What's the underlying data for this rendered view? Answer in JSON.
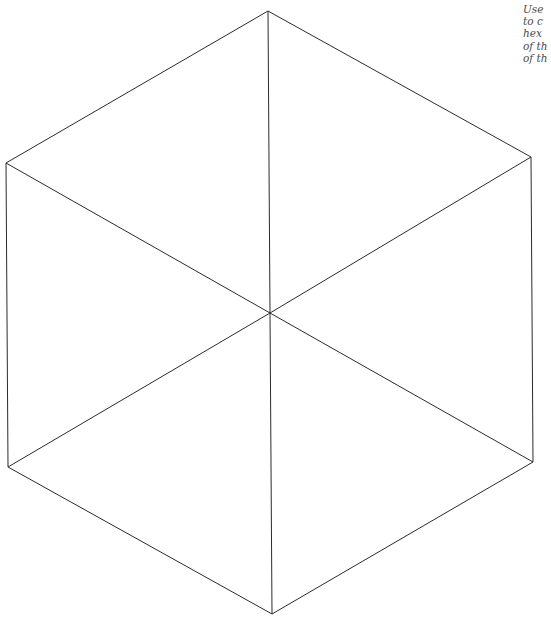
{
  "instructions": {
    "lines": [
      "Use",
      "to c",
      "hex",
      "of th",
      "of th"
    ]
  },
  "hexagon": {
    "stroke_color": "#2b2b2b",
    "stroke_width": 1,
    "center": [
      270,
      313
    ],
    "vertices": {
      "top": [
        268,
        11
      ],
      "upper_right": [
        531,
        157
      ],
      "lower_right": [
        533,
        462
      ],
      "bottom": [
        272,
        614
      ],
      "lower_left": [
        8,
        467
      ],
      "upper_left": [
        6,
        163
      ]
    }
  }
}
